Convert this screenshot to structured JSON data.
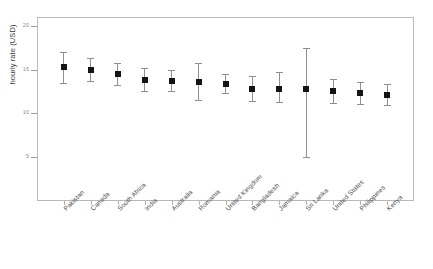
{
  "chart_data": {
    "type": "scatter",
    "title": "",
    "subtitle": "",
    "xlabel": "",
    "ylabel": "hourly rate (USD)",
    "grid": false,
    "legend": null,
    "ylim": [
      0,
      21
    ],
    "y_ticks": [
      20,
      15,
      10,
      5
    ],
    "y_tick_labels": [
      "20",
      "15",
      "10",
      "5"
    ],
    "error_type": "confidence interval",
    "categories": [
      "Pakistan",
      "Canada",
      "South Africa",
      "India",
      "Australia",
      "Romania",
      "United Kingdom",
      "Bangladesh",
      "Jamaica",
      "Sri Lanka",
      "United States",
      "Philippines",
      "Kenya"
    ],
    "values": [
      15.3,
      15.0,
      14.5,
      13.8,
      13.7,
      13.6,
      13.3,
      12.8,
      12.8,
      12.8,
      12.5,
      12.3,
      12.1
    ],
    "err_low": [
      13.5,
      13.7,
      13.2,
      12.5,
      12.5,
      11.5,
      12.3,
      11.4,
      11.3,
      5.0,
      11.2,
      11.1,
      11.0
    ],
    "err_high": [
      17.0,
      16.3,
      15.8,
      15.2,
      15.0,
      15.8,
      14.5,
      14.3,
      14.7,
      17.5,
      13.9,
      13.6,
      13.4
    ],
    "colors": {
      "marker": "#141414",
      "error_bar": "#8f8f8f",
      "frame": "#b9b9b9",
      "tick": "#9a9a9a",
      "tick_label": "#8d8d8d",
      "axis_label": "#3a3a3a",
      "background": "#ffffff"
    }
  }
}
